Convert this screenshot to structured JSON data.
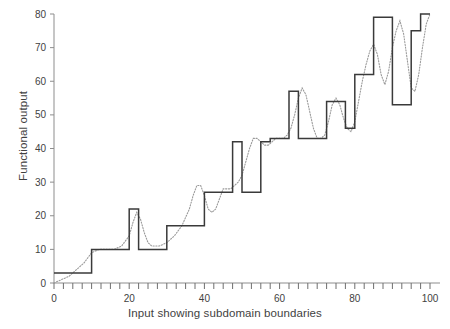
{
  "chart_data": {
    "type": "line",
    "title": "",
    "xlabel": "Input showing subdomain boundaries",
    "ylabel": "Functional output",
    "xlim": [
      0,
      100
    ],
    "ylim": [
      0,
      80
    ],
    "grid": false,
    "legend": "none",
    "x_ticks_major": [
      0,
      20,
      40,
      60,
      80,
      100
    ],
    "x_tick_labels": [
      "0",
      "20",
      "40",
      "60",
      "80",
      "100"
    ],
    "x_minor_tick_step": 2.5,
    "y_ticks": [
      0,
      10,
      20,
      30,
      40,
      50,
      60,
      70,
      80
    ],
    "y_tick_labels": [
      "0",
      "10",
      "20",
      "30",
      "40",
      "50",
      "60",
      "70",
      "80"
    ],
    "series": [
      {
        "name": "Step approximation over subdomains",
        "style": "solid",
        "color": "#3a3a3a",
        "type": "step",
        "subdomain_boundaries": [
          0,
          10,
          20,
          22.5,
          25,
          30,
          35,
          40,
          42.5,
          47.5,
          50,
          55,
          57.5,
          62.5,
          65,
          70,
          72.5,
          75,
          77.5,
          80,
          82.5,
          85,
          87.5,
          90,
          92.5,
          95,
          97.5,
          100
        ],
        "step_values": [
          3,
          10,
          22,
          10,
          10,
          17,
          17,
          27,
          27,
          42,
          27,
          42,
          43,
          57,
          43,
          43,
          54,
          54,
          46,
          62,
          62,
          79,
          79,
          53,
          53,
          75,
          80
        ]
      },
      {
        "name": "Underlying smooth function",
        "style": "dotted",
        "color": "#9a9a9a",
        "type": "line",
        "x": [
          0,
          2,
          4,
          6,
          8,
          10,
          12,
          14,
          16,
          18,
          20,
          21,
          22,
          23,
          24,
          25,
          26,
          28,
          30,
          32,
          34,
          36,
          37,
          38,
          39,
          40,
          41,
          42,
          43,
          44,
          45,
          46,
          47,
          48,
          49,
          50,
          51,
          52,
          53,
          54,
          55,
          56,
          57,
          58,
          59,
          60,
          61,
          62,
          63,
          64,
          65,
          66,
          67,
          68,
          69,
          70,
          71,
          72,
          73,
          74,
          75,
          76,
          77,
          78,
          79,
          80,
          81,
          82,
          83,
          84,
          85,
          86,
          87,
          88,
          89,
          90,
          91,
          92,
          93,
          94,
          95,
          96,
          97,
          98,
          99,
          100
        ],
        "y": [
          0,
          1,
          2,
          4,
          6,
          9,
          10,
          10,
          10,
          11,
          14,
          18,
          21,
          19,
          15,
          12,
          11,
          11,
          12,
          14,
          17,
          22,
          26,
          29,
          29,
          26,
          22,
          21,
          22,
          25,
          28,
          28,
          28,
          29,
          30,
          32,
          36,
          40,
          43,
          43,
          42,
          41,
          41,
          42,
          43,
          43,
          43,
          44,
          46,
          50,
          55,
          58,
          56,
          51,
          46,
          43,
          43,
          44,
          48,
          53,
          55,
          53,
          49,
          46,
          45,
          48,
          54,
          60,
          65,
          69,
          71,
          68,
          62,
          59,
          63,
          70,
          75,
          78,
          74,
          66,
          58,
          57,
          62,
          70,
          77,
          80
        ]
      }
    ]
  }
}
